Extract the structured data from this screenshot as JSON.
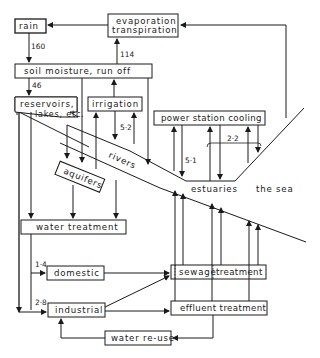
{
  "diagram": {
    "title": "",
    "nodes": {
      "rain": "rain",
      "evaporation_line1": "evaporation",
      "evaporation_line2": "transpiration",
      "soil": "soil moisture, run off",
      "reservoirs_line1": "reservoirs,",
      "reservoirs_line2": "lakes, etc.",
      "irrigation": "irrigation",
      "power": "power station cooling",
      "aquifers": "aquifers",
      "rivers": "rivers",
      "estuaries": "estuaries",
      "sea": "the sea",
      "water_treatment": "water treatment",
      "domestic": "domestic",
      "industrial": "industrial",
      "sewage_a": "sewage",
      "sewage_b": "treatment",
      "effluent": "effluent treatment",
      "reuse": "water re-use"
    },
    "flows": {
      "rain_to_soil": "160",
      "soil_to_evap": "114",
      "soil_to_reservoirs": "46",
      "irrigation": "5·2",
      "power_inland": "5·1",
      "power_coastal": "2·2",
      "domestic": "1·4",
      "industrial": "2·8"
    },
    "colors": {
      "ink": "#1a1a1a",
      "paper": "#ffffff"
    }
  }
}
